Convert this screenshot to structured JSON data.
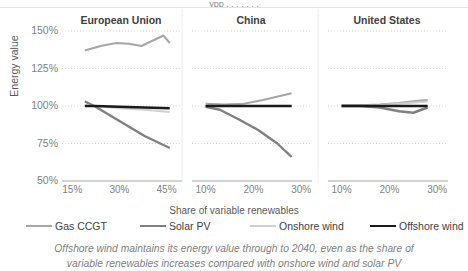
{
  "figure": {
    "cut_off_title": "ypp       .  .   .    .    .  .   .",
    "y_axis_title": "Energy value",
    "x_axis_title": "Share of variable renewables",
    "caption_line1": "Offshore wind maintains its energy value through to 2040, even as the share of",
    "caption_line2": "variable renewables increases compared with onshore wind and solar PV"
  },
  "legend": {
    "position": "bottom",
    "items": [
      {
        "label": "Gas CCGT",
        "color": "#a6a6a6",
        "width": 2.0
      },
      {
        "label": "Solar PV",
        "color": "#7f7f7f",
        "width": 2.4
      },
      {
        "label": "Onshore wind",
        "color": "#d0d0d0",
        "width": 2.0
      },
      {
        "label": "Offshore wind",
        "color": "#1a1a1a",
        "width": 2.6
      }
    ]
  },
  "chart_data": {
    "type": "line",
    "xlabel": "Share of variable renewables",
    "ylabel": "Energy value",
    "ylim": [
      50,
      150
    ],
    "yticks": [
      50,
      75,
      100,
      125,
      150
    ],
    "ytick_labels": [
      "50%",
      "75%",
      "100%",
      "125%",
      "150%"
    ],
    "grid": "horizontal-dotted",
    "panels": [
      {
        "name": "European Union",
        "xlim": [
          13,
          48
        ],
        "xticks": [
          15,
          30,
          45
        ],
        "xtick_labels": [
          "15%",
          "30%",
          "45%"
        ],
        "series": [
          {
            "name": "Gas CCGT",
            "x": [
              19,
              24,
              29,
              33,
              37,
              41,
              44,
              46
            ],
            "y": [
              137,
              140,
              142,
              141.5,
              140,
              144,
              147,
              142
            ]
          },
          {
            "name": "Solar PV",
            "x": [
              19,
              22,
              30,
              38,
              46
            ],
            "y": [
              103,
              100,
              90,
              80,
              72
            ]
          },
          {
            "name": "Onshore wind",
            "x": [
              19,
              22,
              30,
              38,
              46
            ],
            "y": [
              100.5,
              100,
              98.5,
              97.5,
              96
            ]
          },
          {
            "name": "Offshore wind",
            "x": [
              19,
              22,
              30,
              38,
              46
            ],
            "y": [
              100,
              100,
              99.5,
              99,
              98.5
            ]
          }
        ]
      },
      {
        "name": "China",
        "xlim": [
          8,
          31
        ],
        "xticks": [
          10,
          20,
          30
        ],
        "xtick_labels": [
          "10%",
          "20%",
          "30%"
        ],
        "series": [
          {
            "name": "Gas CCGT",
            "x": [
              10,
              14,
              18,
              22,
              26,
              28
            ],
            "y": [
              101.5,
              101,
              101.5,
              104,
              107,
              108.5
            ]
          },
          {
            "name": "Solar PV",
            "x": [
              10,
              13,
              17,
              21,
              25,
              28
            ],
            "y": [
              99.5,
              97.5,
              91,
              84,
              75,
              66
            ]
          },
          {
            "name": "Onshore wind",
            "x": [
              10,
              14,
              18,
              22,
              26,
              28
            ],
            "y": [
              100,
              100,
              100,
              100,
              100,
              100
            ]
          },
          {
            "name": "Offshore wind",
            "x": [
              10,
              14,
              18,
              22,
              26,
              28
            ],
            "y": [
              100,
              100,
              100,
              100,
              100,
              100
            ]
          }
        ]
      },
      {
        "name": "United States",
        "xlim": [
          8,
          31
        ],
        "xticks": [
          10,
          20,
          30
        ],
        "xtick_labels": [
          "10%",
          "20%",
          "30%"
        ],
        "series": [
          {
            "name": "Gas CCGT",
            "x": [
              10,
              14,
              18,
              22,
              26,
              28
            ],
            "y": [
              100.5,
              100.5,
              101,
              102,
              103.5,
              104
            ]
          },
          {
            "name": "Solar PV",
            "x": [
              10,
              14,
              18,
              22,
              25,
              28
            ],
            "y": [
              100,
              100,
              99,
              96.5,
              95.5,
              99
            ]
          },
          {
            "name": "Onshore wind",
            "x": [
              10,
              14,
              18,
              22,
              26,
              28
            ],
            "y": [
              100,
              100,
              100.5,
              101.5,
              102.5,
              103
            ]
          },
          {
            "name": "Offshore wind",
            "x": [
              10,
              14,
              18,
              22,
              26,
              28
            ],
            "y": [
              100,
              100,
              100,
              100,
              100,
              100
            ]
          }
        ]
      }
    ]
  }
}
